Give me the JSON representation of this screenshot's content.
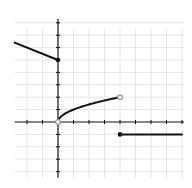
{
  "chart_data": {
    "type": "line",
    "title": "",
    "xlabel": "",
    "ylabel": "",
    "xlim": [
      -2.8,
      8
    ],
    "ylim": [
      -4.5,
      8.3
    ],
    "grid": true,
    "x_ticks": [
      -2,
      -1,
      1,
      2,
      3,
      4,
      5,
      6,
      7,
      8
    ],
    "y_ticks": [
      -4,
      -3,
      -2,
      -1,
      1,
      2,
      3,
      4,
      5,
      6,
      7,
      8
    ],
    "series": [
      {
        "name": "piece-1",
        "description": "linear segment, y = 5 - x/2 for x < 0",
        "points": [
          [
            -2.8,
            6.4
          ],
          [
            0,
            5
          ]
        ],
        "endpoints": [
          {
            "x": 0,
            "y": 5,
            "style": "closed"
          }
        ]
      },
      {
        "name": "piece-2",
        "description": "y = sqrt(x) for 0 < x < 4",
        "points": [
          [
            0,
            0
          ],
          [
            0.25,
            0.5
          ],
          [
            0.5,
            0.71
          ],
          [
            1,
            1
          ],
          [
            1.5,
            1.22
          ],
          [
            2,
            1.41
          ],
          [
            2.5,
            1.58
          ],
          [
            3,
            1.73
          ],
          [
            3.5,
            1.87
          ],
          [
            4,
            2
          ]
        ],
        "endpoints": [
          {
            "x": 0,
            "y": 0,
            "style": "open"
          },
          {
            "x": 4,
            "y": 2,
            "style": "open"
          }
        ]
      },
      {
        "name": "piece-3",
        "description": "constant y = -1 for x >= 4",
        "points": [
          [
            4,
            -1
          ],
          [
            8,
            -1
          ]
        ],
        "endpoints": [
          {
            "x": 4,
            "y": -1,
            "style": "closed"
          }
        ]
      }
    ],
    "colors": {
      "line": "#111111",
      "axis": "#111111",
      "grid": "#e6e6e6",
      "open_dot_fill": "#ffffff",
      "open_dot_stroke": "#999999"
    }
  }
}
